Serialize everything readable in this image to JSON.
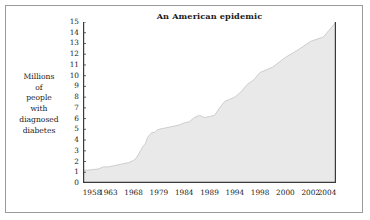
{
  "chart_data": {
    "type": "area",
    "title": "An American epidemic",
    "xlabel": "",
    "ylabel": "Millions of people with diagnosed diabetes",
    "ylabel_lines": [
      "Millions",
      "of",
      "people",
      "with",
      "diagnosed",
      "diabetes"
    ],
    "ylim": [
      0,
      15
    ],
    "xlim": [
      1958,
      2004
    ],
    "grid": false,
    "legend": null,
    "ytick_labels": [
      "15",
      "14",
      "13",
      "12",
      "11",
      "10",
      "9",
      "8",
      "7",
      "6",
      "5",
      "4",
      "3",
      "2",
      "1",
      "0"
    ],
    "ytick_values": [
      15,
      14,
      13,
      12,
      11,
      10,
      9,
      8,
      7,
      6,
      5,
      4,
      3,
      2,
      1,
      0
    ],
    "xtick_labels": [
      "1958",
      "1963",
      "1968",
      "1979",
      "1984",
      "1989",
      "1994",
      "1998",
      "2000",
      "2002",
      "2004"
    ],
    "xtick_values": [
      1958,
      1963,
      1968,
      1979,
      1984,
      1989,
      1994,
      1998,
      2000,
      2002,
      2004
    ],
    "series_name": "Diagnosed diabetes",
    "fill_color": "#e9e9e9",
    "line_color": "#c8c8c8",
    "axis_color": "#3a3a3a",
    "x": [
      1958,
      1959,
      1960,
      1961,
      1962,
      1963,
      1964,
      1965,
      1966,
      1967,
      1968,
      1969,
      1970,
      1971,
      1972,
      1973,
      1974,
      1975,
      1976,
      1977,
      1978,
      1979,
      1980,
      1981,
      1982,
      1983,
      1984,
      1985,
      1986,
      1987,
      1988,
      1989,
      1990,
      1991,
      1992,
      1993,
      1994,
      1995,
      1996,
      1997,
      1998,
      1999,
      2000,
      2001,
      2002,
      2003,
      2004
    ],
    "values": [
      1.2,
      1.2,
      1.25,
      1.3,
      1.5,
      1.5,
      1.6,
      1.7,
      1.8,
      1.9,
      2.1,
      2.3,
      2.6,
      3.0,
      3.4,
      3.6,
      4.2,
      4.5,
      4.7,
      4.7,
      4.9,
      5.0,
      5.1,
      5.2,
      5.3,
      5.4,
      5.6,
      5.7,
      6.1,
      6.3,
      6.1,
      6.2,
      6.3,
      7.0,
      7.6,
      7.8,
      8.0,
      8.5,
      9.2,
      9.6,
      10.3,
      10.8,
      11.7,
      12.4,
      13.2,
      13.6,
      15.0
    ],
    "annotations": []
  }
}
